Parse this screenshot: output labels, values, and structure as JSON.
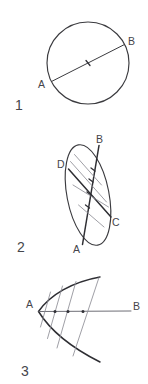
{
  "page": {
    "background_color": "#ffffff",
    "ink_color": "#3b3b3f",
    "light_ink_color": "#8e8e96",
    "width": 148,
    "height": 384
  },
  "figures": [
    {
      "number": "1",
      "name": "circle-with-diameter",
      "shape": "circle",
      "labels": [
        {
          "text": "A",
          "role": "endpoint-lower-left"
        },
        {
          "text": "B",
          "role": "endpoint-upper-right"
        }
      ],
      "marks": [
        {
          "text": "center-tick",
          "role": "midpoint-tick"
        }
      ]
    },
    {
      "number": "2",
      "name": "ellipse-with-conjugate-chords",
      "shape": "ellipse",
      "labels": [
        {
          "text": "A",
          "role": "chord-end-bottom"
        },
        {
          "text": "B",
          "role": "chord-end-top"
        },
        {
          "text": "C",
          "role": "chord-end-lower-right"
        },
        {
          "text": "D",
          "role": "chord-end-upper-left"
        }
      ],
      "marks": [
        {
          "text": "midpoint-tick",
          "role": "chord-midpoint-1"
        },
        {
          "text": "midpoint-tick",
          "role": "chord-midpoint-2"
        },
        {
          "text": "midpoint-tick",
          "role": "chord-midpoint-3"
        },
        {
          "text": "midpoint-tick",
          "role": "chord-midpoint-4"
        }
      ]
    },
    {
      "number": "3",
      "name": "parabola-with-axis-and-chords",
      "shape": "parabola",
      "labels": [
        {
          "text": "A",
          "role": "vertex-left"
        },
        {
          "text": "B",
          "role": "axis-end-right"
        }
      ],
      "marks": [
        {
          "text": "midpoint-dot",
          "role": "chord-midpoint-1"
        },
        {
          "text": "midpoint-dot",
          "role": "chord-midpoint-2"
        },
        {
          "text": "midpoint-dot",
          "role": "chord-midpoint-3"
        }
      ]
    }
  ]
}
